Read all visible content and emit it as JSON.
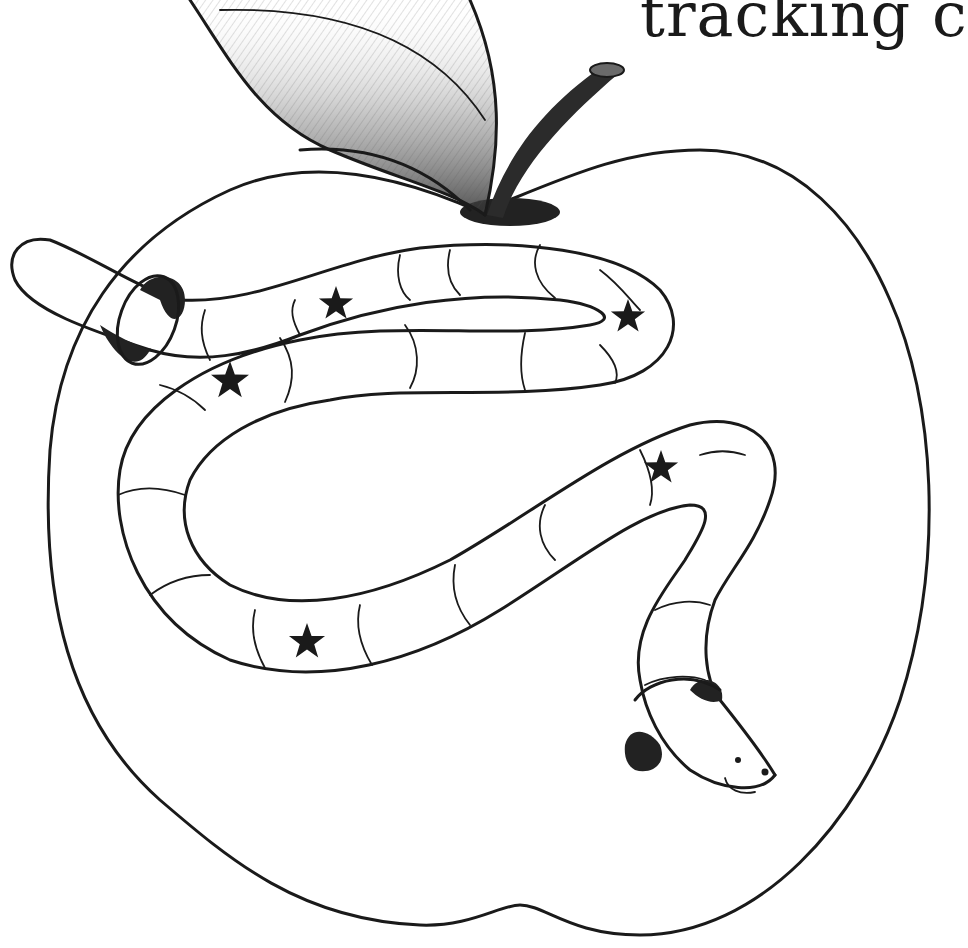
{
  "caption": {
    "text": "tracking c"
  },
  "illustration": {
    "subject": "apple with a worm crawling through it",
    "elements": [
      "apple-outline",
      "leaf",
      "stem",
      "stem-hole",
      "worm",
      "worm-entry-hole",
      "worm-exit-hole",
      "stars",
      "worm-face"
    ],
    "star_count": 5,
    "colors": {
      "line": "#1a1a1a",
      "background": "#ffffff",
      "shading": "#222222"
    }
  }
}
